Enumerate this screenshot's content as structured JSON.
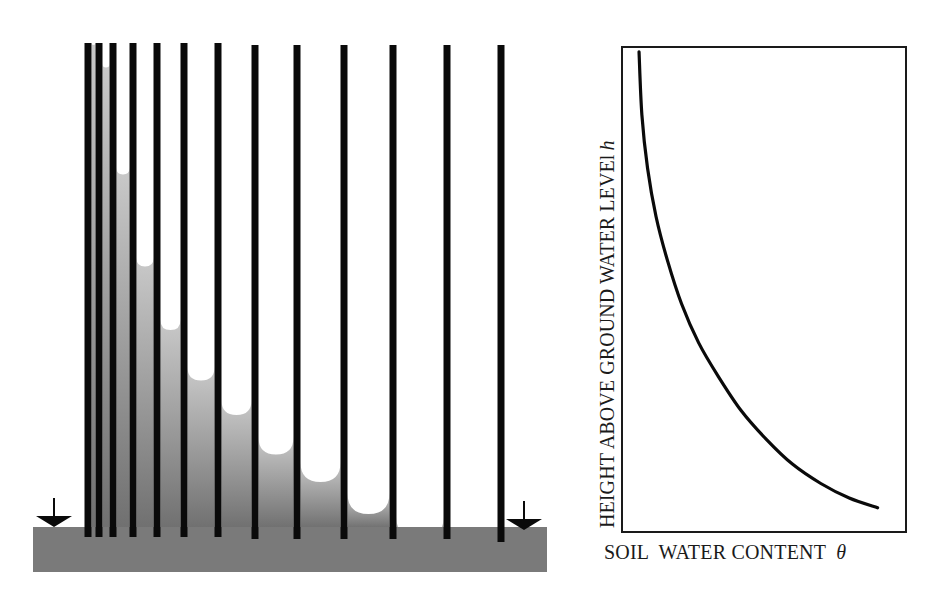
{
  "figure": {
    "left_panel": {
      "title": "Capillary rise in tubes of decreasing diameter",
      "colors": {
        "water_top": "#c9c9c9",
        "water_bottom": "#707070",
        "tube_wall": "#0a0a0a",
        "ground_base": "#7a7a7a",
        "air": "#ffffff"
      },
      "ground_base": {
        "x": 33,
        "y": 527,
        "width": 514,
        "height": 45
      },
      "water_table_markers": [
        {
          "name": "left-water-table-marker",
          "x": 54,
          "y": 527
        },
        {
          "name": "right-water-table-marker",
          "x": 524,
          "y": 530
        }
      ],
      "tube_walls_x": [
        88,
        99,
        113,
        133,
        157,
        184,
        218,
        255,
        297,
        344,
        393,
        447,
        501
      ],
      "tube_walls_top": 43,
      "tube_walls_bottom": 540,
      "wall_width": 7,
      "water_levels_y": [
        43,
        64,
        168,
        258,
        320,
        367,
        400,
        437,
        462,
        493,
        517,
        527
      ]
    },
    "right_panel": {
      "x_label": "SOIL  WATER CONTENT",
      "x_symbol": "θ",
      "y_label": "HEIGHT ABOVE GROUND WATER LEVEl",
      "y_symbol": "h"
    }
  },
  "chart_data": {
    "type": "line",
    "title": "",
    "xlabel": "SOIL WATER CONTENT θ",
    "ylabel": "HEIGHT ABOVE GROUND WATER LEVEL h",
    "grid": false,
    "legend": null,
    "ticks": "none",
    "xlim": [
      0,
      1
    ],
    "ylim": [
      0,
      1
    ],
    "series": [
      {
        "name": "retention curve",
        "x": [
          0.06,
          0.07,
          0.09,
          0.12,
          0.16,
          0.21,
          0.27,
          0.34,
          0.42,
          0.51,
          0.6,
          0.7,
          0.8,
          0.9
        ],
        "y": [
          0.99,
          0.86,
          0.75,
          0.65,
          0.56,
          0.47,
          0.39,
          0.32,
          0.25,
          0.19,
          0.14,
          0.1,
          0.07,
          0.05
        ]
      }
    ],
    "frame": {
      "x": 622,
      "y": 47,
      "width": 284,
      "height": 485
    }
  }
}
